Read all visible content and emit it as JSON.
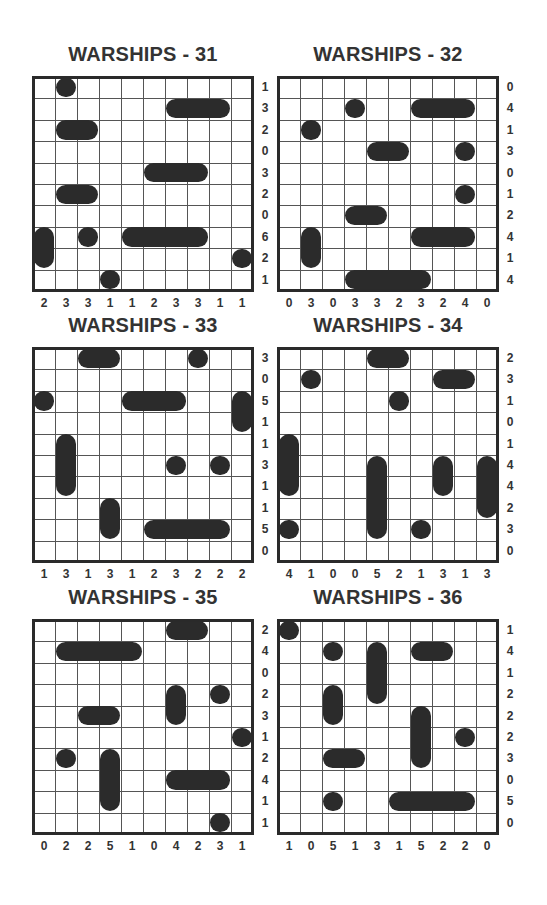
{
  "page": {
    "background": "#ffffff",
    "ship_color": "#2b2b2b",
    "grid_size": 10
  },
  "puzzles": [
    {
      "id": 31,
      "title": "WARSHIPS - 31",
      "position": {
        "x": 33,
        "y": 77
      },
      "row_clues": [
        "1",
        "3",
        "2",
        "0",
        "3",
        "2",
        "0",
        "6",
        "2",
        "1"
      ],
      "col_clues": [
        "2",
        "3",
        "3",
        "1",
        "1",
        "2",
        "3",
        "3",
        "1",
        "1"
      ],
      "ships": [
        {
          "row": 0,
          "col": 1,
          "length": 1,
          "orientation": "h"
        },
        {
          "row": 1,
          "col": 6,
          "length": 3,
          "orientation": "h"
        },
        {
          "row": 2,
          "col": 1,
          "length": 2,
          "orientation": "h"
        },
        {
          "row": 4,
          "col": 5,
          "length": 3,
          "orientation": "h"
        },
        {
          "row": 5,
          "col": 1,
          "length": 2,
          "orientation": "h"
        },
        {
          "row": 7,
          "col": 0,
          "length": 2,
          "orientation": "v"
        },
        {
          "row": 7,
          "col": 2,
          "length": 1,
          "orientation": "h"
        },
        {
          "row": 7,
          "col": 4,
          "length": 4,
          "orientation": "h"
        },
        {
          "row": 8,
          "col": 9,
          "length": 1,
          "orientation": "h"
        },
        {
          "row": 9,
          "col": 3,
          "length": 1,
          "orientation": "h"
        }
      ]
    },
    {
      "id": 32,
      "title": "WARSHIPS - 32",
      "position": {
        "x": 278,
        "y": 77
      },
      "row_clues": [
        "0",
        "4",
        "1",
        "3",
        "0",
        "1",
        "2",
        "4",
        "1",
        "4"
      ],
      "col_clues": [
        "0",
        "3",
        "0",
        "3",
        "3",
        "2",
        "3",
        "2",
        "4",
        "0"
      ],
      "ships": [
        {
          "row": 1,
          "col": 3,
          "length": 1,
          "orientation": "h"
        },
        {
          "row": 1,
          "col": 6,
          "length": 3,
          "orientation": "h"
        },
        {
          "row": 2,
          "col": 1,
          "length": 1,
          "orientation": "h"
        },
        {
          "row": 3,
          "col": 4,
          "length": 2,
          "orientation": "h"
        },
        {
          "row": 3,
          "col": 8,
          "length": 1,
          "orientation": "h"
        },
        {
          "row": 5,
          "col": 8,
          "length": 1,
          "orientation": "h"
        },
        {
          "row": 6,
          "col": 3,
          "length": 2,
          "orientation": "h"
        },
        {
          "row": 7,
          "col": 1,
          "length": 2,
          "orientation": "v"
        },
        {
          "row": 7,
          "col": 6,
          "length": 3,
          "orientation": "h"
        },
        {
          "row": 9,
          "col": 3,
          "length": 4,
          "orientation": "h"
        }
      ]
    },
    {
      "id": 33,
      "title": "WARSHIPS - 33",
      "position": {
        "x": 33,
        "y": 348
      },
      "row_clues": [
        "3",
        "0",
        "5",
        "1",
        "1",
        "3",
        "1",
        "1",
        "5",
        "0"
      ],
      "col_clues": [
        "1",
        "3",
        "1",
        "3",
        "1",
        "2",
        "3",
        "2",
        "2",
        "2"
      ],
      "ships": [
        {
          "row": 0,
          "col": 2,
          "length": 2,
          "orientation": "h"
        },
        {
          "row": 0,
          "col": 7,
          "length": 1,
          "orientation": "h"
        },
        {
          "row": 2,
          "col": 0,
          "length": 1,
          "orientation": "h"
        },
        {
          "row": 2,
          "col": 4,
          "length": 3,
          "orientation": "h"
        },
        {
          "row": 2,
          "col": 9,
          "length": 2,
          "orientation": "v"
        },
        {
          "row": 4,
          "col": 1,
          "length": 3,
          "orientation": "v"
        },
        {
          "row": 5,
          "col": 6,
          "length": 1,
          "orientation": "h"
        },
        {
          "row": 5,
          "col": 8,
          "length": 1,
          "orientation": "h"
        },
        {
          "row": 7,
          "col": 3,
          "length": 2,
          "orientation": "v"
        },
        {
          "row": 8,
          "col": 5,
          "length": 4,
          "orientation": "h"
        }
      ]
    },
    {
      "id": 34,
      "title": "WARSHIPS - 34",
      "position": {
        "x": 278,
        "y": 348
      },
      "row_clues": [
        "2",
        "3",
        "1",
        "0",
        "1",
        "4",
        "4",
        "2",
        "3",
        "0"
      ],
      "col_clues": [
        "4",
        "1",
        "0",
        "0",
        "5",
        "2",
        "1",
        "3",
        "1",
        "3"
      ],
      "ships": [
        {
          "row": 0,
          "col": 4,
          "length": 2,
          "orientation": "h"
        },
        {
          "row": 1,
          "col": 1,
          "length": 1,
          "orientation": "h"
        },
        {
          "row": 1,
          "col": 7,
          "length": 2,
          "orientation": "h"
        },
        {
          "row": 2,
          "col": 5,
          "length": 1,
          "orientation": "h"
        },
        {
          "row": 4,
          "col": 0,
          "length": 3,
          "orientation": "v"
        },
        {
          "row": 5,
          "col": 4,
          "length": 4,
          "orientation": "v"
        },
        {
          "row": 5,
          "col": 7,
          "length": 2,
          "orientation": "v"
        },
        {
          "row": 5,
          "col": 9,
          "length": 3,
          "orientation": "v"
        },
        {
          "row": 8,
          "col": 0,
          "length": 1,
          "orientation": "h"
        },
        {
          "row": 8,
          "col": 6,
          "length": 1,
          "orientation": "h"
        }
      ]
    },
    {
      "id": 35,
      "title": "WARSHIPS - 35",
      "position": {
        "x": 33,
        "y": 620
      },
      "row_clues": [
        "2",
        "4",
        "0",
        "2",
        "3",
        "1",
        "2",
        "4",
        "1",
        "1"
      ],
      "col_clues": [
        "0",
        "2",
        "2",
        "5",
        "1",
        "0",
        "4",
        "2",
        "3",
        "1"
      ],
      "ships": [
        {
          "row": 0,
          "col": 6,
          "length": 2,
          "orientation": "h"
        },
        {
          "row": 1,
          "col": 1,
          "length": 4,
          "orientation": "h"
        },
        {
          "row": 3,
          "col": 6,
          "length": 2,
          "orientation": "v"
        },
        {
          "row": 3,
          "col": 8,
          "length": 1,
          "orientation": "h"
        },
        {
          "row": 4,
          "col": 2,
          "length": 2,
          "orientation": "h"
        },
        {
          "row": 5,
          "col": 9,
          "length": 1,
          "orientation": "h"
        },
        {
          "row": 6,
          "col": 1,
          "length": 1,
          "orientation": "h"
        },
        {
          "row": 6,
          "col": 3,
          "length": 3,
          "orientation": "v"
        },
        {
          "row": 7,
          "col": 6,
          "length": 3,
          "orientation": "h"
        },
        {
          "row": 9,
          "col": 8,
          "length": 1,
          "orientation": "h"
        }
      ]
    },
    {
      "id": 36,
      "title": "WARSHIPS - 36",
      "position": {
        "x": 278,
        "y": 620
      },
      "row_clues": [
        "1",
        "4",
        "1",
        "2",
        "2",
        "2",
        "3",
        "0",
        "5",
        "0"
      ],
      "col_clues": [
        "1",
        "0",
        "5",
        "1",
        "3",
        "1",
        "5",
        "2",
        "2",
        "0"
      ],
      "ships": [
        {
          "row": 0,
          "col": 0,
          "length": 1,
          "orientation": "h"
        },
        {
          "row": 1,
          "col": 2,
          "length": 1,
          "orientation": "h"
        },
        {
          "row": 1,
          "col": 4,
          "length": 3,
          "orientation": "v"
        },
        {
          "row": 1,
          "col": 6,
          "length": 2,
          "orientation": "h"
        },
        {
          "row": 3,
          "col": 2,
          "length": 2,
          "orientation": "v"
        },
        {
          "row": 4,
          "col": 6,
          "length": 3,
          "orientation": "v"
        },
        {
          "row": 5,
          "col": 8,
          "length": 1,
          "orientation": "h"
        },
        {
          "row": 6,
          "col": 2,
          "length": 2,
          "orientation": "h"
        },
        {
          "row": 8,
          "col": 2,
          "length": 1,
          "orientation": "h"
        },
        {
          "row": 8,
          "col": 5,
          "length": 4,
          "orientation": "h"
        }
      ]
    }
  ]
}
